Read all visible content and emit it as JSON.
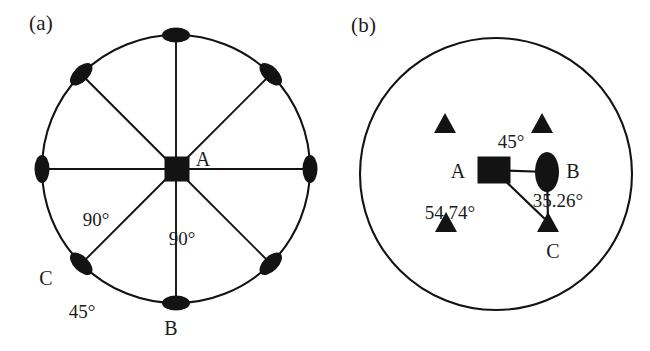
{
  "figure": {
    "width": 650,
    "height": 351,
    "background": "#ffffff",
    "ink_color": "#131313"
  },
  "panels": {
    "a": {
      "label": "(a)",
      "circle": {
        "cx": 176,
        "cy": 169,
        "r": 134
      },
      "center_marker": {
        "shape": "square",
        "label": "A",
        "cx": 177,
        "cy": 169,
        "size": 25
      },
      "rim_markers": [
        {
          "shape": "ellipse",
          "angle_deg": 270,
          "name": "top"
        },
        {
          "shape": "ellipse",
          "angle_deg": 315,
          "name": "upper-right"
        },
        {
          "shape": "ellipse",
          "angle_deg": 0,
          "name": "right"
        },
        {
          "shape": "ellipse",
          "angle_deg": 45,
          "name": "lower-right"
        },
        {
          "shape": "ellipse",
          "angle_deg": 90,
          "name": "bottom"
        },
        {
          "shape": "ellipse",
          "angle_deg": 135,
          "name": "lower-left"
        },
        {
          "shape": "ellipse",
          "angle_deg": 180,
          "name": "left"
        },
        {
          "shape": "ellipse",
          "angle_deg": 225,
          "name": "upper-left"
        }
      ],
      "labels": {
        "A": "A",
        "B": "B",
        "C": "C",
        "angle_left": "90°",
        "angle_right": "90°",
        "angle_arc": "45°"
      },
      "label_positions": {
        "A": {
          "x": 203,
          "y": 166
        },
        "B": {
          "x": 171,
          "y": 335
        },
        "C": {
          "x": 46,
          "y": 285
        },
        "angle_left": {
          "x": 96,
          "y": 226
        },
        "angle_right": {
          "x": 182,
          "y": 245
        },
        "angle_arc": {
          "x": 82,
          "y": 318
        }
      }
    },
    "b": {
      "label": "(b)",
      "circle": {
        "cx": 171,
        "cy": 174,
        "r": 136
      },
      "nodes": [
        {
          "id": "A",
          "shape": "square",
          "cx": 169,
          "cy": 170,
          "w": 33,
          "h": 27
        },
        {
          "id": "B",
          "shape": "ellipse",
          "cx": 222,
          "cy": 172,
          "rx": 12,
          "ry": 20
        },
        {
          "id": "C",
          "shape": "triangle",
          "cx": 223,
          "cy": 222,
          "size": 22
        },
        {
          "id": "t1",
          "shape": "triangle",
          "cx": 120,
          "cy": 123,
          "size": 22
        },
        {
          "id": "t2",
          "shape": "triangle",
          "cx": 217,
          "cy": 123,
          "size": 22
        },
        {
          "id": "t3",
          "shape": "triangle",
          "cx": 121,
          "cy": 222,
          "size": 22
        }
      ],
      "bonds": [
        {
          "from": "A",
          "to": "B"
        },
        {
          "from": "A",
          "to": "C"
        },
        {
          "from": "B",
          "to": "C"
        }
      ],
      "labels": {
        "A": "A",
        "B": "B",
        "C": "C",
        "angle_ab": "45°",
        "angle_bc": "35.26°",
        "angle_ac": "54.74°"
      },
      "label_positions": {
        "A": {
          "x": 133,
          "y": 178
        },
        "B": {
          "x": 248,
          "y": 178
        },
        "C": {
          "x": 228,
          "y": 258
        },
        "angle_ab": {
          "x": 186,
          "y": 148
        },
        "angle_bc": {
          "x": 233,
          "y": 207
        },
        "angle_ac": {
          "x": 125,
          "y": 219
        }
      }
    }
  }
}
